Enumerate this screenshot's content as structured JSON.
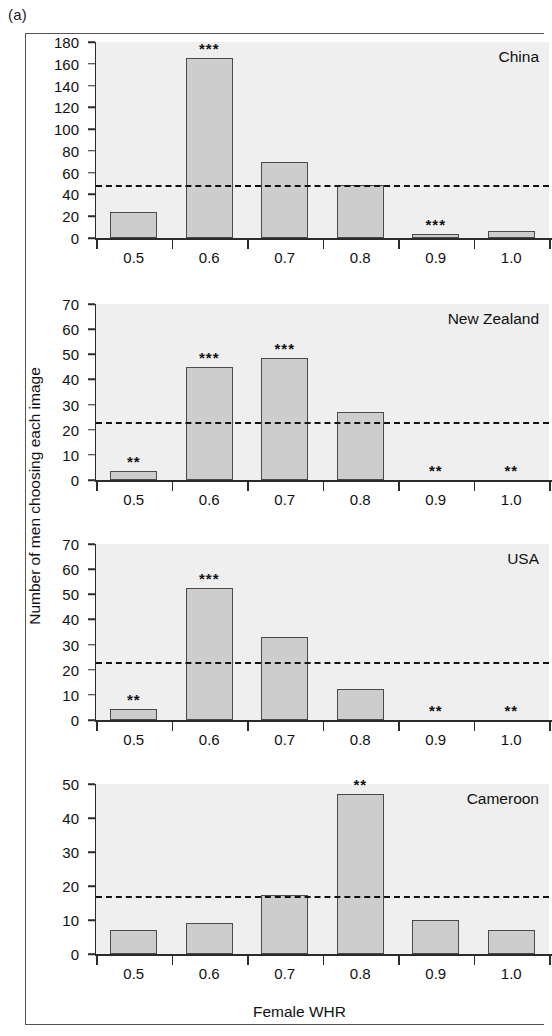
{
  "figure": {
    "panel_letter": "(a)",
    "x_axis_title": "Female WHR",
    "y_axis_title": "Number of men choosing each image"
  },
  "chart_data": {
    "type": "bar",
    "title": "",
    "xlabel": "Female WHR",
    "ylabel": "Number of men choosing each image",
    "categories": [
      "0.5",
      "0.6",
      "0.7",
      "0.8",
      "0.9",
      "1.0"
    ],
    "grid": false,
    "legend": "none",
    "panels": [
      {
        "name": "China",
        "ylim": [
          0,
          180
        ],
        "yticks": [
          0,
          20,
          40,
          60,
          80,
          100,
          120,
          140,
          160,
          180
        ],
        "values": [
          24,
          165,
          70,
          49,
          4,
          6
        ],
        "significance": [
          "",
          "***",
          "",
          "",
          "***",
          ""
        ],
        "chance_line": 49
      },
      {
        "name": "New Zealand",
        "ylim": [
          0,
          70
        ],
        "yticks": [
          0,
          10,
          20,
          30,
          40,
          50,
          60,
          70
        ],
        "values": [
          3.5,
          45,
          48.5,
          27,
          0,
          0
        ],
        "significance": [
          "**",
          "***",
          "***",
          "",
          "**",
          "**"
        ],
        "chance_line": 23
      },
      {
        "name": "USA",
        "ylim": [
          0,
          70
        ],
        "yticks": [
          0,
          10,
          20,
          30,
          40,
          50,
          60,
          70
        ],
        "values": [
          4.5,
          52.5,
          33,
          12.5,
          0,
          0
        ],
        "significance": [
          "**",
          "***",
          "",
          "",
          "**",
          "**"
        ],
        "chance_line": 23
      },
      {
        "name": "Cameroon",
        "ylim": [
          0,
          50
        ],
        "yticks": [
          0,
          10,
          20,
          30,
          40,
          50
        ],
        "values": [
          7,
          9,
          17.5,
          47,
          10,
          7
        ],
        "significance": [
          "",
          "",
          "",
          "**",
          "",
          ""
        ],
        "chance_line": 17
      }
    ]
  },
  "colors": {
    "bar_fill": "#cdcdcd",
    "bar_stroke": "#4a4a4a",
    "plot_background": "#efefef",
    "axis": "#2b2b2b",
    "text": "#111111"
  }
}
